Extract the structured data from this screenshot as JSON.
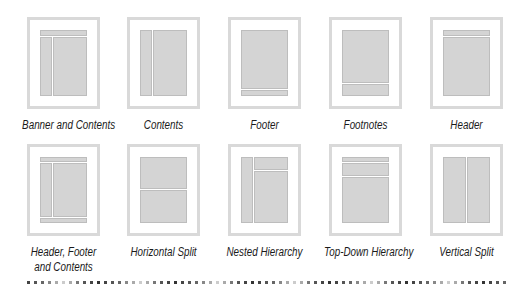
{
  "layouts": [
    {
      "id": "banner-and-contents",
      "label": [
        "Banner and Contents"
      ],
      "row": 0,
      "col": 0
    },
    {
      "id": "contents",
      "label": [
        "Contents"
      ],
      "row": 0,
      "col": 1
    },
    {
      "id": "footer",
      "label": [
        "Footer"
      ],
      "row": 0,
      "col": 2
    },
    {
      "id": "footnotes",
      "label": [
        "Footnotes"
      ],
      "row": 0,
      "col": 3
    },
    {
      "id": "header",
      "label": [
        "Header"
      ],
      "row": 0,
      "col": 4
    },
    {
      "id": "header-footer-and-contents",
      "label": [
        "Header, Footer",
        "and Contents"
      ],
      "row": 1,
      "col": 0
    },
    {
      "id": "horizontal-split",
      "label": [
        "Horizontal Split"
      ],
      "row": 1,
      "col": 1
    },
    {
      "id": "nested-hierarchy",
      "label": [
        "Nested Hierarchy"
      ],
      "row": 1,
      "col": 2
    },
    {
      "id": "top-down-hierarchy",
      "label": [
        "Top-Down Hierarchy"
      ],
      "row": 1,
      "col": 3
    },
    {
      "id": "vertical-split",
      "label": [
        "Vertical Split"
      ],
      "row": 1,
      "col": 4
    }
  ],
  "colors": {
    "frame": "#d9d9d9",
    "block": "#d4d4d4",
    "block_border": "#bdbdbd",
    "text": "#1a1a1a"
  }
}
